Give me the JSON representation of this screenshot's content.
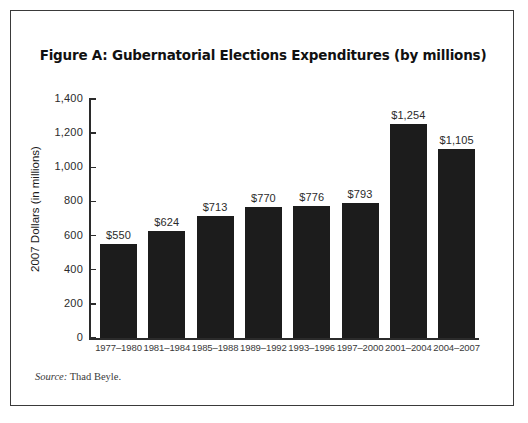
{
  "figure": {
    "title": "Figure A: Gubernatorial Elections Expenditures (by millions)",
    "source_label": "Source:",
    "source_text": " Thad Beyle.",
    "frame_color": "#3a3a3a",
    "bar_color": "#1c1c1c",
    "background": "#ffffff"
  },
  "chart_data": {
    "type": "bar",
    "title": "Figure A: Gubernatorial Elections Expenditures (by millions)",
    "xlabel": "",
    "ylabel": "2007 Dollars (in millions)",
    "ylim": [
      0,
      1400
    ],
    "yticks": [
      0,
      200,
      400,
      600,
      800,
      1000,
      1200,
      1400
    ],
    "ytick_labels": [
      "0",
      "200",
      "400",
      "600",
      "800",
      "1,000",
      "1,200",
      "1,400"
    ],
    "grid": false,
    "legend": false,
    "categories": [
      "1977–1980",
      "1981–1984",
      "1985–1988",
      "1989–1992",
      "1993–1996",
      "1997–2000",
      "2001–2004",
      "2004–2007"
    ],
    "values": [
      550,
      624,
      713,
      770,
      776,
      793,
      1254,
      1105
    ],
    "data_labels": [
      "$550",
      "$624",
      "$713",
      "$770",
      "$776",
      "$793",
      "$1,254",
      "$1,105"
    ]
  }
}
